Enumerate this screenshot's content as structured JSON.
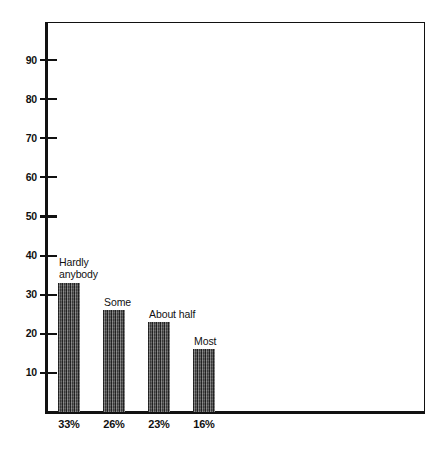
{
  "chart_data": {
    "type": "bar",
    "title": "",
    "subtitle": "",
    "xlabel": "",
    "ylabel": "",
    "categories": [
      "Hardly anybody",
      "Some",
      "About half",
      "Most"
    ],
    "values": [
      33,
      26,
      23,
      16
    ],
    "value_labels": [
      "33%",
      "26%",
      "23%",
      "16%"
    ],
    "category_label_lines": [
      [
        "Hardly",
        "anybody"
      ],
      [
        "Some"
      ],
      [
        "About half"
      ],
      [
        "Most"
      ]
    ],
    "ylim": [
      0,
      100
    ],
    "yticks": [
      10,
      20,
      30,
      40,
      50,
      60,
      70,
      80,
      90
    ],
    "ytick_labels": [
      "10",
      "20",
      "30",
      "40",
      "50",
      "60",
      "70",
      "80",
      "90"
    ],
    "grid": false,
    "legend": null,
    "legend_position": "none",
    "bar_color": "#4d4d4d",
    "axis_color": "#111111",
    "background_color": "#ffffff",
    "bar_fill_pattern": "vertical-hatch"
  },
  "axis": {
    "ticks": [
      {
        "label": "90",
        "value": 90
      },
      {
        "label": "80",
        "value": 80
      },
      {
        "label": "70",
        "value": 70
      },
      {
        "label": "60",
        "value": 60
      },
      {
        "label": "50",
        "value": 50
      },
      {
        "label": "40",
        "value": 40
      },
      {
        "label": "30",
        "value": 30
      },
      {
        "label": "20",
        "value": 20
      },
      {
        "label": "10",
        "value": 10
      }
    ]
  },
  "bars": [
    {
      "category": "Hardly anybody",
      "label_line1": "Hardly",
      "label_line2": "anybody",
      "value": 33,
      "percent": "33%"
    },
    {
      "category": "Some",
      "label_line1": "Some",
      "label_line2": "",
      "value": 26,
      "percent": "26%"
    },
    {
      "category": "About half",
      "label_line1": "About half",
      "label_line2": "",
      "value": 23,
      "percent": "23%"
    },
    {
      "category": "Most",
      "label_line1": "Most",
      "label_line2": "",
      "value": 16,
      "percent": "16%"
    }
  ]
}
